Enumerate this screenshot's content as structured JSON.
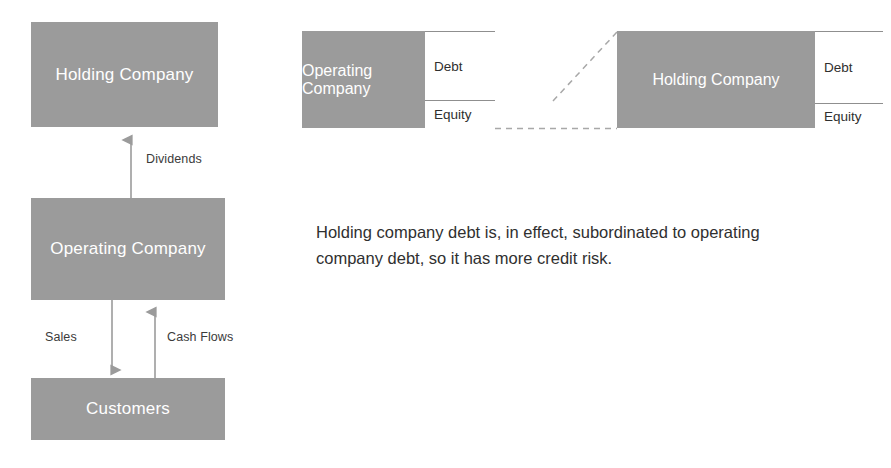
{
  "diagram": {
    "gray": "#9b9b9b",
    "left_flow": {
      "nodes": [
        {
          "id": "holding",
          "label": "Holding Company"
        },
        {
          "id": "operating",
          "label": "Operating Company"
        },
        {
          "id": "customers",
          "label": "Customers"
        }
      ],
      "arrows": [
        {
          "id": "dividends",
          "label": "Dividends",
          "from": "operating",
          "to": "holding",
          "direction": "up"
        },
        {
          "id": "sales",
          "label": "Sales",
          "from": "operating",
          "to": "customers",
          "direction": "down"
        },
        {
          "id": "cash-flows",
          "label": "Cash Flows",
          "from": "customers",
          "to": "operating",
          "direction": "up"
        }
      ]
    },
    "balance_sheets": [
      {
        "id": "operating-bs",
        "entity": "Operating Company",
        "capital": [
          {
            "label": "Debt"
          },
          {
            "label": "Equity"
          }
        ]
      },
      {
        "id": "holding-bs",
        "entity": "Holding Company",
        "capital": [
          {
            "label": "Debt"
          },
          {
            "label": "Equity"
          }
        ]
      }
    ],
    "connector": {
      "id": "subordination-connector",
      "style": "dashed",
      "description": "Dashed line linking operating company equity to holding company assets"
    },
    "note": "Holding company debt is, in effect, subordinated to operating company debt, so it has more credit risk."
  }
}
